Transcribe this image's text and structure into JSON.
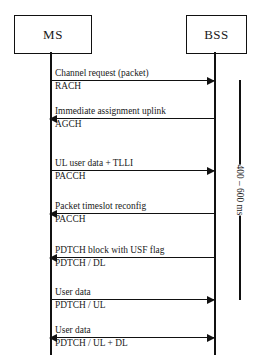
{
  "diagram": {
    "type": "sequence-diagram",
    "nodes": [
      {
        "id": "ms",
        "label": "MS"
      },
      {
        "id": "bss",
        "label": "BSS"
      }
    ],
    "messages": [
      {
        "label": "Channel request (packet)",
        "channel": "RACH",
        "direction": "right"
      },
      {
        "label": "Immediate assignment uplink",
        "channel": "AGCH",
        "direction": "left"
      },
      {
        "label": "UL user data + TLLI",
        "channel": "PACCH",
        "direction": "right"
      },
      {
        "label": "Packet timeslot reconfig",
        "channel": "PACCH",
        "direction": "left"
      },
      {
        "label": "PDTCH block with USF flag",
        "channel": "PDTCH / DL",
        "direction": "left"
      },
      {
        "label": "User data",
        "channel": "PDTCH / UL",
        "direction": "right"
      },
      {
        "label": "User data",
        "channel": "PDTCH / UL + DL",
        "direction": "both"
      }
    ],
    "timing": {
      "label": "400 – 600 ms"
    },
    "colors": {
      "line": "#111111",
      "background": "#ffffff",
      "text": "#1a1a1a"
    }
  }
}
